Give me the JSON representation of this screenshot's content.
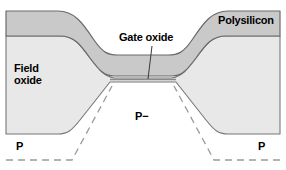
{
  "figure": {
    "width": 286,
    "height": 170,
    "background_color": "#ffffff"
  },
  "labels": {
    "polysilicon": "Polysilicon",
    "gate_oxide": "Gate oxide",
    "field_oxide_line1": "Field",
    "field_oxide_line2": "oxide",
    "substrate_lightly_doped": "P−",
    "p_well_left": "P",
    "p_well_right": "P"
  },
  "colors": {
    "polysilicon_fill": "#c9c9c9",
    "oxide_fill": "#e8e8e8",
    "outline": "#555555",
    "dashed_junction": "#999999",
    "leader_line": "#444444",
    "text": "#000000",
    "background": "#ffffff"
  },
  "geometry": {
    "poly_top_left_plateau_y": 11,
    "poly_bottom_left_plateau_y": 36,
    "poly_top_center_y": 55,
    "poly_bottom_center_y": 72,
    "field_oxide_left_bottom_y": 134,
    "gate_oxide_center_y": 78,
    "dashed_outer_bottom_y": 160,
    "left_slope_start_x": 60,
    "left_slope_end_x": 110,
    "right_slope_start_x": 176,
    "right_slope_end_x": 226
  },
  "leader": {
    "name": "gate-oxide-leader-line",
    "from_x": 152,
    "from_y": 46,
    "to_x": 148,
    "to_y": 78
  }
}
